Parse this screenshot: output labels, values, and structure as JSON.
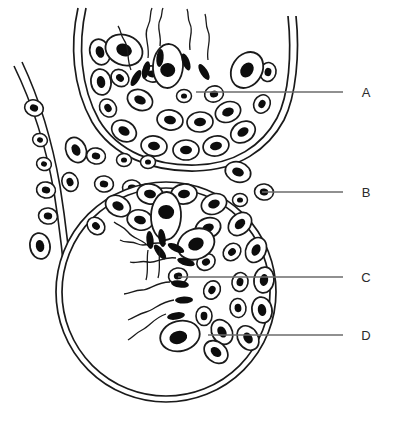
{
  "figure": {
    "background_color": "#ffffff",
    "ink_color": "#1a1a1a",
    "nucleus_color": "#0d0d0d",
    "cytoplasm_color": "#ffffff",
    "leader_line_color": "#6b6b6b",
    "label_text_color": "#2b2b2b"
  },
  "labels": [
    {
      "id": "A",
      "text": "A",
      "label_x": 366,
      "label_y": 97,
      "leader_x1": 343,
      "leader_x2": 196,
      "leader_y": 92,
      "target": "germinal-epithelium-cell-upper-tubule"
    },
    {
      "id": "B",
      "text": "B",
      "label_x": 366,
      "label_y": 197,
      "leader_x1": 343,
      "leader_x2": 262,
      "leader_y": 192,
      "target": "interstitial-leydig-cell"
    },
    {
      "id": "C",
      "text": "C",
      "label_x": 366,
      "label_y": 282,
      "leader_x1": 343,
      "leader_x2": 178,
      "leader_y": 277,
      "target": "spermatid-layer-lower-tubule"
    },
    {
      "id": "D",
      "text": "D",
      "label_x": 366,
      "label_y": 340,
      "leader_x1": 343,
      "leader_x2": 208,
      "leader_y": 335,
      "target": "sertoli-cell-lower-tubule"
    }
  ],
  "structures": {
    "upper_tubule": {
      "name": "upper-seminiferous-tubule",
      "note": "Arc cut off by the top edge of the frame; double-line basement membrane with stratified germ cells and spermatozoa whose tails project into the lumen."
    },
    "lower_tubule": {
      "name": "lower-seminiferous-tubule",
      "note": "Large round tubule with double-line wall; cells crowd the upper-right arc, the lumen below is empty, spermatozoa tails fan toward the lumen centre."
    },
    "left_tubule": {
      "name": "left-partial-tubule",
      "note": "Partial third tubule entering from the left edge, double wall with a single row of cells."
    },
    "interstitium": {
      "name": "interstitial-tissue",
      "note": "Cluster of small rounded interstitial (Leydig) cells in the wedge between the three tubules."
    }
  }
}
